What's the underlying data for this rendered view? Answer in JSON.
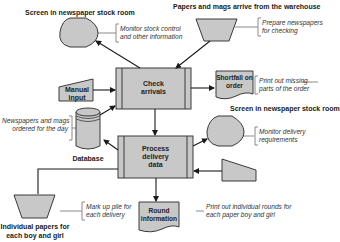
{
  "diagram": {
    "type": "system-flowchart",
    "colors": {
      "shape_fill": "#c8c8c8",
      "stroke": "#3a3a3a",
      "connector": "#888888",
      "text": "#1a1a1a"
    },
    "nodes": {
      "screen_stock": {
        "shape": "display",
        "heading": "Screen in newspaper stock room",
        "note": [
          "Monitor stock control",
          "and other information"
        ]
      },
      "warehouse": {
        "shape": "manual-operation",
        "heading": "Papers and mags arrive from the warehouse",
        "note": [
          "Prepare newspapers",
          "for checking"
        ]
      },
      "check_arrivals": {
        "shape": "predefined-process",
        "label": [
          "Check",
          "arrivals"
        ]
      },
      "manual_input": {
        "shape": "manual-input",
        "label": [
          "Manual",
          "input"
        ]
      },
      "shortfall": {
        "shape": "document",
        "label": [
          "Shortfall on",
          "order"
        ],
        "note": [
          "Print out missing",
          "parts of the order"
        ]
      },
      "database": {
        "shape": "cylinder",
        "label": "Database",
        "note": [
          "Newspapers and mags",
          "ordered for the day"
        ]
      },
      "screen_delivery": {
        "shape": "display",
        "heading": "Screen in newspaper stock room",
        "note": [
          "Monitor delivery",
          "requirements"
        ]
      },
      "process_delivery": {
        "shape": "predefined-process",
        "label": [
          "Process",
          "delivery",
          "data"
        ]
      },
      "keyboard_input": {
        "shape": "manual-input"
      },
      "individual_papers": {
        "shape": "manual-operation",
        "caption": [
          "Individual papers for",
          "each boy and girl"
        ],
        "note": [
          "Mark up pile for",
          "each delivery"
        ]
      },
      "round_info": {
        "shape": "document",
        "label": [
          "Round",
          "information"
        ],
        "note": [
          "Print out individual rounds for",
          "each paper boy and girl"
        ]
      }
    },
    "edges": [
      {
        "from": "check_arrivals",
        "to": "screen_stock"
      },
      {
        "from": "warehouse",
        "to": "check_arrivals"
      },
      {
        "from": "manual_input",
        "to": "check_arrivals"
      },
      {
        "from": "database",
        "to": "check_arrivals"
      },
      {
        "from": "check_arrivals",
        "to": "shortfall"
      },
      {
        "from": "check_arrivals",
        "to": "process_delivery"
      },
      {
        "from": "process_delivery",
        "to": "database"
      },
      {
        "from": "process_delivery",
        "to": "screen_delivery"
      },
      {
        "from": "keyboard_input",
        "to": "process_delivery"
      },
      {
        "from": "process_delivery",
        "to": "individual_papers"
      },
      {
        "from": "process_delivery",
        "to": "round_info"
      }
    ]
  }
}
